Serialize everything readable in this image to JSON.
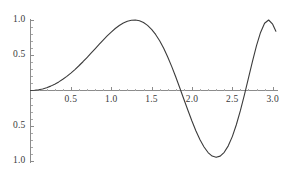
{
  "chart_data": {
    "type": "line",
    "title": "",
    "xlabel": "",
    "ylabel": "",
    "xlim": [
      0.0,
      3.06
    ],
    "ylim": [
      -1.08,
      1.06
    ],
    "grid": false,
    "legend": null,
    "axes": {
      "x_axis_at_y": 0.0,
      "y_axis_at_x": 0.0,
      "x_tick_labels": [
        "0.5",
        "1.0",
        "1.5",
        "2.0",
        "2.5",
        "3.0"
      ],
      "x_tick_values": [
        0.5,
        1.0,
        1.5,
        2.0,
        2.5,
        3.0
      ],
      "y_tick_labels": [
        "1.0",
        "0.5",
        "0.5",
        "1.0"
      ],
      "y_tick_values": [
        1.0,
        0.5,
        -0.5,
        -1.0
      ],
      "minor_ticks": true
    },
    "series": [
      {
        "name": "curve",
        "color": "#3c3c3c",
        "line_width": 1.0,
        "x": [
          0.0,
          0.05,
          0.1,
          0.15,
          0.2,
          0.25,
          0.3,
          0.35,
          0.4,
          0.45,
          0.5,
          0.55,
          0.6,
          0.65,
          0.7,
          0.75,
          0.8,
          0.85,
          0.9,
          0.95,
          1.0,
          1.05,
          1.1,
          1.15,
          1.2,
          1.25,
          1.3,
          1.35,
          1.4,
          1.45,
          1.5,
          1.55,
          1.6,
          1.65,
          1.7,
          1.75,
          1.8,
          1.85,
          1.9,
          1.95,
          2.0,
          2.05,
          2.1,
          2.15,
          2.2,
          2.25,
          2.3,
          2.35,
          2.4,
          2.45,
          2.5,
          2.55,
          2.6,
          2.65,
          2.7,
          2.75,
          2.8,
          2.85,
          2.9,
          2.95,
          3.0,
          3.04
        ],
        "y": [
          0.0,
          0.003,
          0.01,
          0.022,
          0.04,
          0.062,
          0.09,
          0.122,
          0.159,
          0.2,
          0.247,
          0.297,
          0.351,
          0.408,
          0.468,
          0.529,
          0.592,
          0.654,
          0.716,
          0.775,
          0.829,
          0.879,
          0.922,
          0.957,
          0.983,
          0.997,
          1.0,
          0.989,
          0.964,
          0.924,
          0.868,
          0.795,
          0.705,
          0.598,
          0.475,
          0.339,
          0.191,
          0.035,
          -0.124,
          -0.281,
          -0.433,
          -0.574,
          -0.698,
          -0.802,
          -0.88,
          -0.93,
          -0.948,
          -0.931,
          -0.877,
          -0.785,
          -0.654,
          -0.486,
          -0.286,
          -0.062,
          0.176,
          0.414,
          0.637,
          0.824,
          0.954,
          1.0,
          0.94,
          0.84
        ],
        "markers": "none",
        "annotations": {
          "first_peak": {
            "x": 1.3,
            "y": 1.0
          },
          "zero_crossing": {
            "x": 1.86,
            "y": 0.0
          },
          "trough": {
            "x": 2.3,
            "y": -0.95
          },
          "second_zero_crossing": {
            "x": 2.67,
            "y": 0.0
          },
          "second_peak": {
            "x": 2.95,
            "y": 1.0
          },
          "end_point": {
            "x": 3.04,
            "y": 0.84
          }
        }
      }
    ],
    "style": {
      "axis_color": "#8c8c8c",
      "curve_color": "#3c3c3c",
      "tick_color": "#8c8c8c",
      "label_color": "#3a3a3a",
      "background": "#ffffff"
    }
  }
}
